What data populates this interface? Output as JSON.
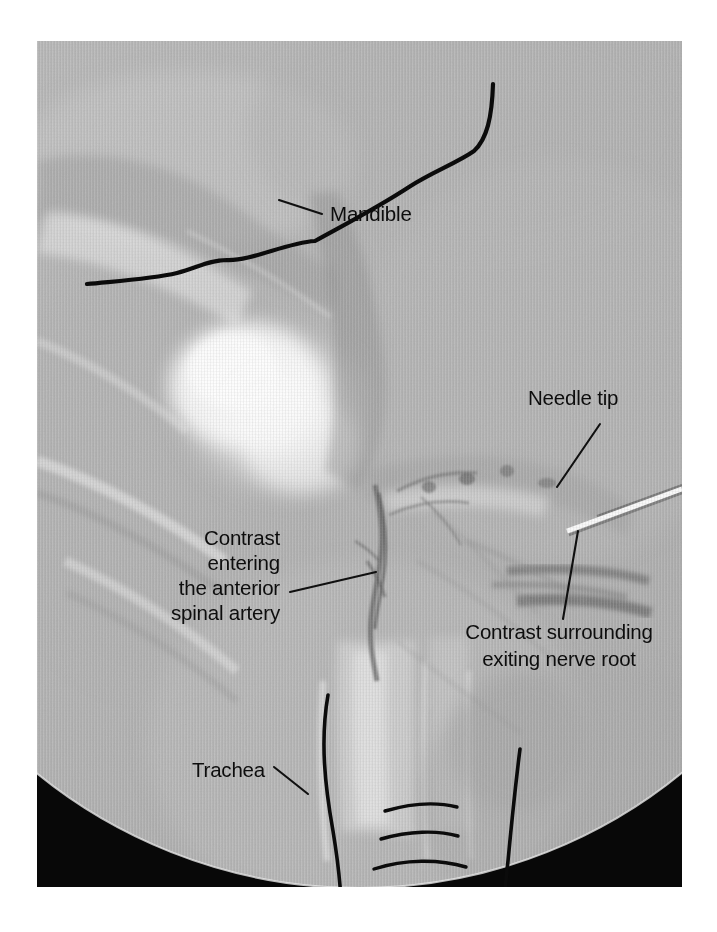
{
  "figure": {
    "modality": "fluoroscopy",
    "view": "cervical spine oblique fluoroscopic image with contrast injection",
    "field_of_view_shape": "circular image intensifier field with black corners",
    "background_color": "#ffffff",
    "image_area": {
      "x": 37,
      "y": 41,
      "width": 645,
      "height": 846
    },
    "ink_color": "#0b0b0b"
  },
  "annotations": [
    {
      "id": "mandible",
      "label_lines": [
        "Mandible"
      ],
      "align": "start",
      "text_x": 330,
      "text_y": 221,
      "leader": "M 279 200 L 322 214"
    },
    {
      "id": "needle-tip",
      "label_lines": [
        "Needle tip"
      ],
      "align": "start",
      "text_x": 528,
      "text_y": 405,
      "leader": "M 600 424 L 557 487"
    },
    {
      "id": "contrast-anterior-spinal-artery",
      "label_lines": [
        "Contrast",
        "entering",
        "the anterior",
        "spinal artery"
      ],
      "align": "end",
      "text_x": 280,
      "text_y": 545,
      "line_height": 25,
      "leader": "M 290 592 L 376 572"
    },
    {
      "id": "contrast-exiting-nerve-root",
      "label_lines": [
        "Contrast surrounding",
        "exiting nerve root"
      ],
      "align": "middle",
      "text_x": 559,
      "text_y": 639,
      "line_height": 27,
      "leader": "M 578 531 L 563 619"
    },
    {
      "id": "trachea",
      "label_lines": [
        "Trachea"
      ],
      "align": "end",
      "text_x": 265,
      "text_y": 777,
      "leader": "M 274 767 L 308 794"
    }
  ],
  "overlay_tracings": [
    {
      "id": "mandible-outline",
      "name": "mandible-outline-curve",
      "stroke_width": 4.2,
      "path": "M 50 243 C 80 240 115 238 140 232 C 160 227 172 219 190 219 C 215 220 248 202 278 200 C 305 185 340 167 372 146 C 395 131 420 122 437 110 C 450 98 455 76 456 43"
    },
    {
      "id": "trachea-left-wall",
      "name": "trachea-left-wall-curve",
      "stroke_width": 3.6,
      "path": "M 291 654 C 283 700 288 745 296 790 C 301 820 303 842 304 858"
    },
    {
      "id": "trachea-right-wall",
      "name": "trachea-right-wall-curve",
      "stroke_width": 3.6,
      "path": "M 483 708 C 478 748 474 788 471 820 C 469 838 468 849 467 857"
    },
    {
      "id": "tracheal-ring-1",
      "name": "tracheal-ring-arc-upper",
      "stroke_width": 3.4,
      "path": "M 348 770 C 375 762 400 761 420 766"
    },
    {
      "id": "tracheal-ring-2",
      "name": "tracheal-ring-arc-middle",
      "stroke_width": 3.4,
      "path": "M 344 798 C 372 790 400 789 421 795"
    },
    {
      "id": "tracheal-ring-3",
      "name": "tracheal-ring-arc-lower",
      "stroke_width": 3.4,
      "path": "M 337 828 C 368 818 402 818 429 826"
    }
  ],
  "image_features": [
    {
      "id": "needle-shaft",
      "name": "radiopaque-needle-shaft"
    },
    {
      "id": "vertebral-body",
      "name": "bright-vertebral-body"
    },
    {
      "id": "contrast-column",
      "name": "contrast-column-anterior-spinal-artery"
    },
    {
      "id": "nerve-root-contrast",
      "name": "contrast-blush-exiting-nerve-root"
    }
  ]
}
